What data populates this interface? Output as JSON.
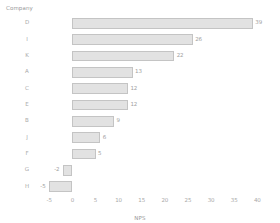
{
  "chart_data": {
    "type": "bar",
    "orientation": "horizontal",
    "title": "",
    "xlabel": "NPS",
    "ylabel": "Company",
    "categories": [
      "D",
      "I",
      "K",
      "A",
      "C",
      "E",
      "B",
      "J",
      "F",
      "G",
      "H"
    ],
    "values": [
      39,
      26,
      22,
      13,
      12,
      12,
      9,
      6,
      5,
      -2,
      -5
    ],
    "value_labels": [
      "39",
      "26",
      "22",
      "13",
      "12",
      "12",
      "9",
      "6",
      "5",
      "-2",
      "-5"
    ],
    "xlim": [
      -7,
      41
    ],
    "xticks": [
      -5,
      0,
      5,
      10,
      15,
      20,
      25,
      30,
      35,
      40
    ],
    "xtick_labels": [
      "-5",
      "0",
      "5",
      "10",
      "15",
      "20",
      "25",
      "30",
      "35",
      "40"
    ],
    "grid": false,
    "legend": null,
    "sorted": "descending",
    "bar_fill": "#e2e2e2",
    "bar_border": "#c4c4c4",
    "text_color": "#a0a0a0"
  }
}
